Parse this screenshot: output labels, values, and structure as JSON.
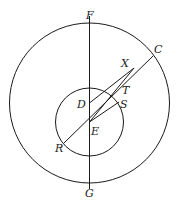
{
  "diagram": {
    "type": "geometry",
    "stroke_color": "#1a1a1a",
    "outer_circle": {
      "cx": 89.5,
      "cy": 103,
      "r": 80
    },
    "inner_circle": {
      "cx": 89.5,
      "cy": 122,
      "r": 34
    },
    "points": {
      "F": {
        "label": "F",
        "x": 89.5,
        "y": 23
      },
      "G": {
        "label": "G",
        "x": 89.5,
        "y": 183
      },
      "C": {
        "label": "C",
        "x": 153,
        "y": 56
      },
      "X": {
        "label": "X",
        "x": 134,
        "y": 68
      },
      "T": {
        "label": "T",
        "x": 123,
        "y": 88
      },
      "S": {
        "label": "S",
        "x": 119,
        "y": 102
      },
      "D": {
        "label": "D",
        "x": 89.5,
        "y": 103
      },
      "E": {
        "label": "E",
        "x": 89.5,
        "y": 122
      },
      "R": {
        "label": "R",
        "x": 64,
        "y": 143
      }
    },
    "segments": [
      [
        "F",
        "G"
      ],
      [
        "R",
        "C"
      ],
      [
        "D",
        "X"
      ],
      [
        "E",
        "X"
      ],
      [
        "E",
        "S"
      ]
    ]
  },
  "labels": {
    "F": "F",
    "G": "G",
    "C": "C",
    "X": "X",
    "T": "T",
    "S": "S",
    "D": "D",
    "E": "E",
    "R": "R"
  }
}
